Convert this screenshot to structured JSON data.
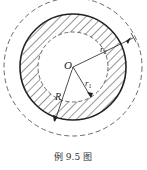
{
  "figure": {
    "caption": "例 9.5 图",
    "labels": {
      "center": "O",
      "outer_radius": "R",
      "inner_radius": "r",
      "inner_radius_sub": "1",
      "mid_radius": "r",
      "mid_radius_sub": "2"
    },
    "colors": {
      "stroke": "#222222",
      "hatch": "#333333",
      "background": "#ffffff"
    }
  }
}
